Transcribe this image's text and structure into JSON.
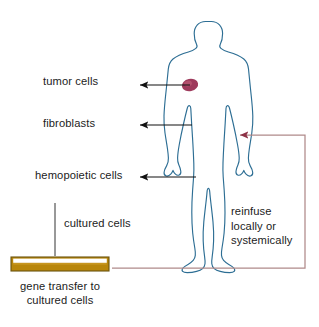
{
  "figure": {
    "labels": {
      "tumor_cells": "tumor cells",
      "fibroblasts": "fibroblasts",
      "hemopoietic_cells": "hemopoietic cells",
      "cultured_cells": "cultured cells",
      "reinfuse": "reinfuse locally or systemically",
      "gene_transfer": "gene transfer to cultured cells"
    },
    "colors": {
      "body_outline": "#2d6e94",
      "tumor_marker": "#9e3a5c",
      "reinfuse_path": "#b08a8a",
      "arrow_black": "#111111",
      "dish_fill": "#b8860b",
      "dish_border": "#6b5410",
      "dish_highlight": "#ffffff",
      "background": "#ffffff",
      "text": "#1c1c1c"
    },
    "icons": {
      "human_body": "human-body-icon",
      "tumor": "tumor-marker-icon",
      "dish": "culture-dish-icon",
      "arrow_left": "arrow-left-icon"
    }
  }
}
